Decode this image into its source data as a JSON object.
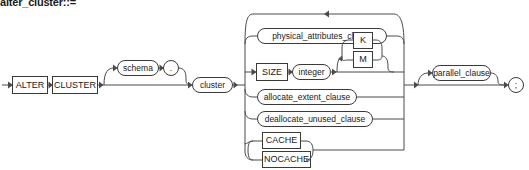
{
  "diagram": {
    "title": "alter_cluster::=",
    "type": "railroad-syntax-diagram",
    "colors": {
      "background": "#ffffff",
      "stroke": "#4a4a4a",
      "box_stroke": "#3a3a3a",
      "text": "#1a1a1a"
    },
    "keywords": {
      "alter": "ALTER",
      "cluster_kw": "CLUSTER",
      "size": "SIZE",
      "k": "K",
      "m": "M",
      "cache": "CACHE",
      "nocache": "NOCACHE"
    },
    "nonterminals": {
      "schema": "schema",
      "cluster": "cluster",
      "integer": "integer",
      "physical_attributes_clause": "physical_attributes_clause",
      "allocate_extent_clause": "allocate_extent_clause",
      "deallocate_unused_clause": "deallocate_unused_clause",
      "parallel_clause": "parallel_clause"
    },
    "punctuation": {
      "dot": ".",
      "semicolon": ";"
    },
    "branches": [
      "physical_attributes_clause",
      "SIZE integer [ K | M ]",
      "allocate_extent_clause",
      "deallocate_unused_clause",
      "CACHE | NOCACHE"
    ]
  }
}
